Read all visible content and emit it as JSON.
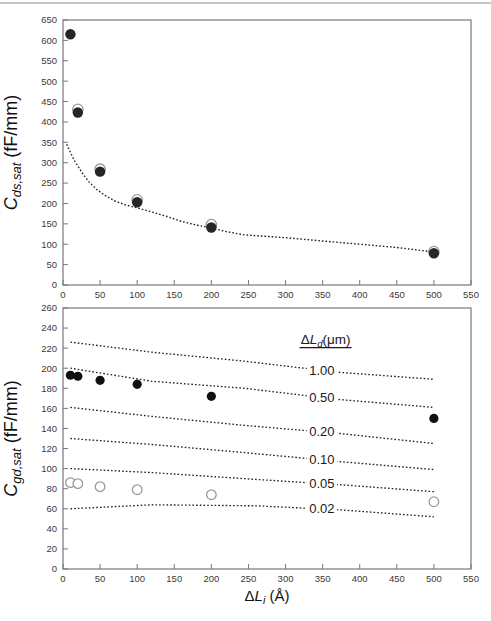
{
  "style": {
    "top_rule": "#c6c6c6",
    "frame": "#787878",
    "tick_label": "#3a3a3a",
    "axis_title": "#111111",
    "dotted_line": "#222222",
    "filled_marker_top": "#262626",
    "filled_marker_bottom": "#101010",
    "open_marker_stroke": "#9a9a9a",
    "line_label": "#1a1a1a",
    "background": "#ffffff"
  },
  "chart_data": [
    {
      "id": "cds",
      "type": "scatter",
      "title": "",
      "xlabel": "",
      "ylabel": "C_ds,sat (fF/mm)",
      "ylabel_segments": [
        {
          "t": "C",
          "i": true
        },
        {
          "t": "ds,sat",
          "i": true,
          "sub": true
        },
        {
          "t": " (fF/mm)"
        }
      ],
      "xlim": [
        0,
        550
      ],
      "xtick_step": 50,
      "ylim": [
        0,
        650
      ],
      "ytick_step": 50,
      "grid": false,
      "legend_position": "none",
      "series": [
        {
          "name": "model-dotted-curve",
          "kind": "dotted-line",
          "points": [
            [
              5,
              345
            ],
            [
              10,
              325
            ],
            [
              15,
              306
            ],
            [
              20,
              292
            ],
            [
              27,
              272
            ],
            [
              35,
              253
            ],
            [
              45,
              235
            ],
            [
              57,
              219
            ],
            [
              70,
              206
            ],
            [
              85,
              196
            ],
            [
              100,
              189
            ],
            [
              120,
              179
            ],
            [
              140,
              168
            ],
            [
              160,
              156
            ],
            [
              180,
              147
            ],
            [
              200,
              140
            ],
            [
              220,
              131
            ],
            [
              245,
              123
            ],
            [
              270,
              120
            ],
            [
              300,
              116
            ],
            [
              350,
              108
            ],
            [
              400,
              100
            ],
            [
              450,
              92
            ],
            [
              500,
              81
            ]
          ]
        },
        {
          "name": "open-circles",
          "kind": "marker-open",
          "r": 5.2,
          "points": [
            [
              20,
              431
            ],
            [
              50,
              284
            ],
            [
              100,
              209
            ],
            [
              200,
              148
            ],
            [
              500,
              82
            ]
          ]
        },
        {
          "name": "filled-circles",
          "kind": "marker-filled",
          "r": 5.2,
          "points": [
            [
              10,
              615
            ],
            [
              20,
              423
            ],
            [
              50,
              278
            ],
            [
              100,
              203
            ],
            [
              200,
              141
            ],
            [
              500,
              78
            ]
          ]
        }
      ]
    },
    {
      "id": "cgd",
      "type": "scatter",
      "title": "",
      "xlabel": "ΔL_i (Å)",
      "xlabel_segments": [
        {
          "t": "Δ"
        },
        {
          "t": "L",
          "i": true
        },
        {
          "t": "i",
          "i": true,
          "sub": true
        },
        {
          "t": " (Å)"
        }
      ],
      "ylabel": "C_gd,sat (fF/mm)",
      "ylabel_segments": [
        {
          "t": "C",
          "i": true
        },
        {
          "t": "gd,sat",
          "i": true,
          "sub": true
        },
        {
          "t": " (fF/mm)"
        }
      ],
      "xlim": [
        0,
        550
      ],
      "xtick_step": 50,
      "ylim": [
        0,
        260
      ],
      "ytick_step": 20,
      "grid": false,
      "legend": {
        "title": "ΔL_d(μm)",
        "title_segments": [
          {
            "t": "Δ"
          },
          {
            "t": "L",
            "i": true
          },
          {
            "t": "d",
            "i": true,
            "sub": true
          },
          {
            "t": "(μm)"
          }
        ],
        "underline": true,
        "anchor": [
          354,
          228
        ]
      },
      "lines": [
        {
          "label": "1.00",
          "label_x": 349,
          "points": [
            [
              10,
              226
            ],
            [
              120,
              216
            ],
            [
              245,
              207
            ],
            [
              370,
              196
            ],
            [
              500,
              189
            ]
          ]
        },
        {
          "label": "0.50",
          "label_x": 349,
          "points": [
            [
              10,
              200
            ],
            [
              120,
              187
            ],
            [
              245,
              180
            ],
            [
              370,
              169
            ],
            [
              500,
              161
            ]
          ]
        },
        {
          "label": "0.20",
          "label_x": 349,
          "points": [
            [
              10,
              161
            ],
            [
              120,
              152
            ],
            [
              245,
              143
            ],
            [
              373,
              135
            ],
            [
              500,
              125
            ]
          ]
        },
        {
          "label": "0.10",
          "label_x": 349,
          "points": [
            [
              10,
              130
            ],
            [
              120,
              124
            ],
            [
              245,
              116
            ],
            [
              373,
              107
            ],
            [
              500,
              99
            ]
          ]
        },
        {
          "label": "0.05",
          "label_x": 349,
          "points": [
            [
              10,
              100
            ],
            [
              120,
              96
            ],
            [
              245,
              90
            ],
            [
              373,
              84
            ],
            [
              500,
              77
            ]
          ]
        },
        {
          "label": "0.02",
          "label_x": 349,
          "points": [
            [
              10,
              60
            ],
            [
              120,
              64
            ],
            [
              260,
              63
            ],
            [
              373,
              59
            ],
            [
              500,
              52
            ]
          ]
        }
      ],
      "series": [
        {
          "name": "filled-circles",
          "kind": "marker-filled",
          "r": 4.6,
          "points": [
            [
              10,
              193
            ],
            [
              20,
              192
            ],
            [
              50,
              188
            ],
            [
              100,
              184
            ],
            [
              200,
              172
            ],
            [
              500,
              150
            ]
          ]
        },
        {
          "name": "open-circles",
          "kind": "marker-open",
          "r": 4.8,
          "points": [
            [
              10,
              86
            ],
            [
              20,
              85
            ],
            [
              50,
              82
            ],
            [
              100,
              79
            ],
            [
              200,
              74
            ],
            [
              500,
              67
            ]
          ]
        }
      ]
    }
  ]
}
